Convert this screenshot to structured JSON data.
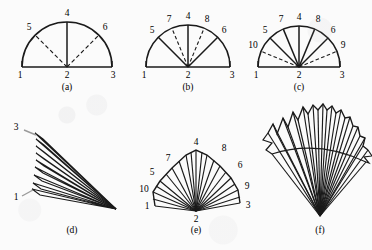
{
  "figure": {
    "kind": "line-diagram",
    "background_color": "#fbfbfb",
    "ink_color": "#1a1a1a",
    "panels": [
      {
        "id": "a",
        "caption": "(a)",
        "type": "semicircle-with-creases",
        "center_label": "2",
        "solid_rays": [
          "4"
        ],
        "dashed_rays": [
          "5",
          "6"
        ],
        "vertex_labels": [
          {
            "label": "1",
            "angle_deg": 180,
            "position": "baseline-left"
          },
          {
            "label": "2",
            "angle_deg": null,
            "position": "center"
          },
          {
            "label": "3",
            "angle_deg": 0,
            "position": "baseline-right"
          },
          {
            "label": "4",
            "angle_deg": 90,
            "position": "arc-top"
          },
          {
            "label": "5",
            "angle_deg": 135,
            "position": "arc-upper-left"
          },
          {
            "label": "6",
            "angle_deg": 45,
            "position": "arc-upper-right"
          }
        ]
      },
      {
        "id": "b",
        "caption": "(b)",
        "type": "semicircle-with-creases",
        "center_label": "2",
        "solid_rays": [
          "4",
          "5",
          "6"
        ],
        "dashed_rays": [
          "7",
          "8"
        ],
        "vertex_labels": [
          {
            "label": "1",
            "angle_deg": 180,
            "position": "baseline-left"
          },
          {
            "label": "2",
            "angle_deg": null,
            "position": "center"
          },
          {
            "label": "3",
            "angle_deg": 0,
            "position": "baseline-right"
          },
          {
            "label": "4",
            "angle_deg": 90,
            "position": "arc-top"
          },
          {
            "label": "5",
            "angle_deg": 135,
            "position": "arc-upper-left"
          },
          {
            "label": "6",
            "angle_deg": 45,
            "position": "arc-upper-right"
          },
          {
            "label": "7",
            "angle_deg": 112.5,
            "position": "arc-top-left"
          },
          {
            "label": "8",
            "angle_deg": 67.5,
            "position": "arc-top-right"
          }
        ]
      },
      {
        "id": "c",
        "caption": "(c)",
        "type": "semicircle-with-creases",
        "center_label": "2",
        "solid_rays": [
          "4",
          "5",
          "6",
          "7",
          "8"
        ],
        "dashed_rays": [
          "9",
          "10"
        ],
        "vertex_labels": [
          {
            "label": "1",
            "angle_deg": 180,
            "position": "baseline-left"
          },
          {
            "label": "2",
            "angle_deg": null,
            "position": "center"
          },
          {
            "label": "3",
            "angle_deg": 0,
            "position": "baseline-right"
          },
          {
            "label": "4",
            "angle_deg": 90,
            "position": "arc-top"
          },
          {
            "label": "5",
            "angle_deg": 135,
            "position": "arc-upper-left"
          },
          {
            "label": "6",
            "angle_deg": 45,
            "position": "arc-upper-right"
          },
          {
            "label": "7",
            "angle_deg": 112.5,
            "position": "arc-top-left"
          },
          {
            "label": "8",
            "angle_deg": 67.5,
            "position": "arc-top-right"
          },
          {
            "label": "9",
            "angle_deg": 22.5,
            "position": "arc-lower-right"
          },
          {
            "label": "10",
            "angle_deg": 157.5,
            "position": "arc-lower-left"
          }
        ]
      },
      {
        "id": "d",
        "caption": "(d)",
        "type": "collapsed-pleated-fan",
        "pleat_count": 8,
        "apex": "lower-right",
        "vertex_labels": [
          {
            "label": "3",
            "position": "upper-left"
          },
          {
            "label": "1",
            "position": "lower-left"
          }
        ]
      },
      {
        "id": "e",
        "caption": "(e)",
        "type": "opened-pleated-fan",
        "apex_label": "2",
        "pleat_count": 16,
        "vertex_labels": [
          {
            "label": "1",
            "position": "left-low"
          },
          {
            "label": "10",
            "position": "left-mid"
          },
          {
            "label": "5",
            "position": "left-upper"
          },
          {
            "label": "7",
            "position": "top-left"
          },
          {
            "label": "4",
            "position": "top"
          },
          {
            "label": "8",
            "position": "top-right"
          },
          {
            "label": "6",
            "position": "right-upper"
          },
          {
            "label": "9",
            "position": "right-mid"
          },
          {
            "label": "3",
            "position": "right-low"
          },
          {
            "label": "2",
            "position": "apex-bottom"
          }
        ]
      },
      {
        "id": "f",
        "caption": "(f)",
        "type": "fully-opened-scalloped-fan",
        "pleat_count": 20,
        "apex": "bottom",
        "vertex_labels": []
      }
    ]
  }
}
